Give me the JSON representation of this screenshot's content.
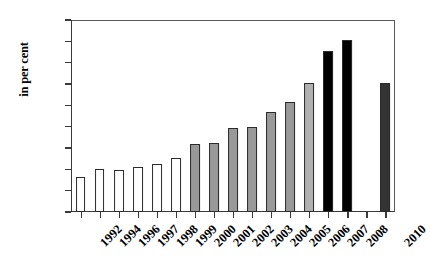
{
  "chart_data": {
    "type": "bar",
    "title": "",
    "subtitle": "",
    "xlabel": "",
    "ylabel": "in per cent",
    "ylim": [
      0,
      18
    ],
    "y_ticks": [
      0,
      2,
      4,
      6,
      8,
      10,
      12,
      14,
      16,
      18
    ],
    "grid": false,
    "legend": false,
    "categories": [
      "1992",
      "1994",
      "1996",
      "1997",
      "1998",
      "1999",
      "2000",
      "2001",
      "2002",
      "2003",
      "2004",
      "2005",
      "2006",
      "2007",
      "2008",
      "2009",
      "2010"
    ],
    "values": [
      3.3,
      4.0,
      3.9,
      4.2,
      4.5,
      5.1,
      6.35,
      6.5,
      7.85,
      7.95,
      9.4,
      10.3,
      12.1,
      15.1,
      16.1,
      null,
      12.1
    ],
    "bar_colors": [
      "#ffffff",
      "#ffffff",
      "#ffffff",
      "#ffffff",
      "#ffffff",
      "#ffffff",
      "#999999",
      "#999999",
      "#999999",
      "#999999",
      "#999999",
      "#999999",
      "#b0b0b0",
      "#000000",
      "#000000",
      null,
      "#333333"
    ]
  },
  "axis": {
    "y_title": "in per cent",
    "y_tick_labels": [
      "0",
      "2",
      "4",
      "6",
      "8",
      "10",
      "12",
      "14",
      "16",
      "18"
    ],
    "x_tick_labels": [
      "1992",
      "1994",
      "1996",
      "1997",
      "1998",
      "1999",
      "2000",
      "2001",
      "2002",
      "2003",
      "2004",
      "2005",
      "2006",
      "2007",
      "2008",
      "2009",
      "2010"
    ]
  },
  "colors": {
    "axis": "#3a3a3a",
    "frame": "#5a5a5a",
    "bar_white": "#ffffff",
    "bar_gray": "#999999",
    "bar_light_gray": "#b0b0b0",
    "bar_black": "#000000",
    "bar_dark_gray": "#333333",
    "background": "#ffffff",
    "text": "#000000"
  }
}
